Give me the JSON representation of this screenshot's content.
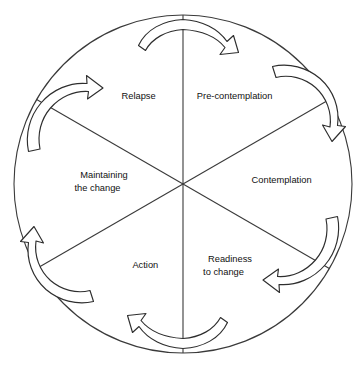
{
  "figure": {
    "name": "stages-of-change-cycle",
    "shape": "circle",
    "center": {
      "x": 183,
      "y": 184
    },
    "radius": 169,
    "stroke_color": "#3a3a3a",
    "background_color": "#ffffff",
    "text_color": "#111111",
    "direction": "clockwise",
    "sector_count": 6
  },
  "sectors": [
    {
      "id": "pre-contemplation",
      "label_line1": "Pre-contemplation",
      "label_line2": "",
      "label_x": 232,
      "label_y": 99,
      "angle_deg": 30
    },
    {
      "id": "contemplation",
      "label_line1": "Contemplation",
      "label_line2": "",
      "label_x": 279,
      "label_y": 183,
      "angle_deg": 90
    },
    {
      "id": "readiness-to-change",
      "label_line1": "Readiness",
      "label_line2": "to change",
      "label_x": 230,
      "label_y": 262,
      "angle_deg": 150
    },
    {
      "id": "action",
      "label_line1": "Action",
      "label_line2": "",
      "label_x": 143,
      "label_y": 268,
      "angle_deg": 210
    },
    {
      "id": "maintaining-the-change",
      "label_line1": "Maintaining",
      "label_line2": "the change",
      "label_x": 104,
      "label_y": 178,
      "angle_deg": 270
    },
    {
      "id": "relapse",
      "label_line1": "Relapse",
      "label_line2": "",
      "label_x": 136,
      "label_y": 99,
      "angle_deg": 330
    }
  ],
  "arrows": [
    {
      "id": "arrow-top",
      "position": "top",
      "points_toward": "right"
    },
    {
      "id": "arrow-upper-right",
      "position": "upper-right",
      "points_toward": "lower-right"
    },
    {
      "id": "arrow-lower-right",
      "position": "lower-right",
      "points_toward": "lower-left"
    },
    {
      "id": "arrow-bottom",
      "position": "bottom",
      "points_toward": "left"
    },
    {
      "id": "arrow-lower-left",
      "position": "lower-left",
      "points_toward": "upper-left"
    },
    {
      "id": "arrow-upper-left",
      "position": "upper-left",
      "points_toward": "upper-right"
    }
  ]
}
